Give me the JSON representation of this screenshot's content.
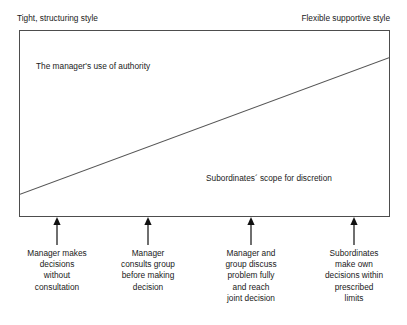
{
  "diagram": {
    "title_top_left": "Tight, structuring style",
    "title_top_right": "Flexible supportive style",
    "upper_region_label": "The manager's use of authority",
    "lower_region_label": "Subordinates´ scope for discretion",
    "colors": {
      "background": "#ffffff",
      "border": "#4d4d4d",
      "divider_line": "#555555",
      "text": "#1a1a1a",
      "arrow": "#111111"
    },
    "markers": [
      {
        "name": "manager-decides",
        "x": 57,
        "icon": "up-arrow-icon",
        "lines": [
          "Manager makes",
          "decisions",
          "without",
          "consultation"
        ]
      },
      {
        "name": "manager-consults",
        "x": 148,
        "icon": "up-arrow-icon",
        "lines": [
          "Manager",
          "consults group",
          "before making",
          "decision"
        ]
      },
      {
        "name": "joint-decision",
        "x": 251,
        "icon": "up-arrow-icon",
        "lines": [
          "Manager and",
          "group discuss",
          "problem fully",
          "and reach",
          "joint decision"
        ]
      },
      {
        "name": "subordinates-decide",
        "x": 354,
        "icon": "up-arrow-icon",
        "lines": [
          "Subordinates",
          "make own",
          "decisions within",
          "prescribed",
          "limits"
        ]
      }
    ],
    "divider": {
      "start_x_pct": 0,
      "start_y_pct": 88.2,
      "end_x_pct": 100,
      "end_y_pct": 14.4
    }
  }
}
